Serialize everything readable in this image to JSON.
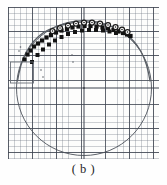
{
  "figure": {
    "caption": "( b )",
    "panel_label": "b",
    "colors": {
      "grid_fine": "#6e7682",
      "grid_major": "#3c424e",
      "circle": "#4a4f58",
      "fit_curve": "#5a5f66",
      "marker_fill": "#111111",
      "marker_open": "#1a1a1a",
      "highlight_box": "#6b7078",
      "caption_text": "#1d1d1d",
      "paper": "#fdfdfc"
    },
    "elements": {
      "circle_label": "reference-circle",
      "box_label": "region-of-interest",
      "center_label": "circle-center",
      "curve_label": "fitted-arc"
    }
  },
  "chart_data": {
    "type": "scatter",
    "title": "",
    "subtitle": "",
    "xlabel": "",
    "ylabel": "",
    "xlim": [
      0,
      151
    ],
    "ylim": [
      0,
      152
    ],
    "grid": true,
    "grid_minor_spacing": 6.05,
    "grid_major_spacing": 24.2,
    "legend": "none",
    "annotations": [
      {
        "name": "reference-circle",
        "type": "circle",
        "cx": 76,
        "cy": 81,
        "r": 67.5,
        "stroke": "#4a4f58",
        "stroke_width": 0.9,
        "fill": "none"
      },
      {
        "name": "circle-center",
        "type": "point",
        "x": 76,
        "y": 81,
        "size": 1.6,
        "color": "#3a3f47"
      },
      {
        "name": "region-of-interest",
        "type": "rect",
        "x": 2.5,
        "y": 55,
        "width": 23,
        "height": 21,
        "stroke": "#6b7078",
        "stroke_width": 0.9,
        "fill": "none"
      },
      {
        "name": "horizontal-axis",
        "type": "line",
        "x1": 0,
        "y1": 81,
        "x2": 151,
        "y2": 81,
        "stroke": "#3c424e",
        "stroke_width": 1.0
      },
      {
        "name": "vertical-axis",
        "type": "line",
        "x1": 76,
        "y1": 0,
        "x2": 76,
        "y2": 152,
        "stroke": "#3c424e",
        "stroke_width": 1.0
      }
    ],
    "series": [
      {
        "name": "fitted-arc",
        "type": "line",
        "stroke": "#5a5f66",
        "stroke_width": 1.3,
        "points": [
          [
            9.5,
            74
          ],
          [
            11,
            66
          ],
          [
            13,
            58
          ],
          [
            15.5,
            51
          ],
          [
            18.5,
            44.5
          ],
          [
            22,
            39
          ],
          [
            26,
            34
          ],
          [
            30.5,
            29.5
          ],
          [
            35.5,
            25.5
          ],
          [
            41,
            22.5
          ],
          [
            47,
            20
          ],
          [
            53,
            18
          ],
          [
            59.5,
            16.5
          ],
          [
            66,
            15.5
          ],
          [
            72.5,
            15
          ],
          [
            79,
            15
          ],
          [
            85.5,
            15.5
          ],
          [
            92,
            16.5
          ],
          [
            98.5,
            18
          ],
          [
            104.5,
            20
          ],
          [
            110.5,
            22.5
          ],
          [
            116,
            25.5
          ],
          [
            121,
            29.5
          ],
          [
            125.5,
            34
          ],
          [
            129.5,
            39
          ],
          [
            133,
            44.5
          ],
          [
            136,
            51
          ],
          [
            138.5,
            58
          ],
          [
            140.5,
            66
          ],
          [
            142,
            74
          ]
        ]
      },
      {
        "name": "filled-square-markers",
        "type": "scatter",
        "marker": "square",
        "color": "#111111",
        "size": 4.2,
        "points": [
          [
            16.5,
            52.5
          ],
          [
            19.5,
            47.5
          ],
          [
            22.5,
            43.5
          ],
          [
            26,
            39.5
          ],
          [
            30,
            36.5
          ],
          [
            34,
            33.5
          ],
          [
            38.5,
            30.5
          ],
          [
            43,
            28
          ],
          [
            48,
            25.5
          ],
          [
            53.5,
            23.5
          ],
          [
            59,
            22
          ],
          [
            64.5,
            20.5
          ],
          [
            70.5,
            19.5
          ],
          [
            76.5,
            19
          ],
          [
            82.5,
            19
          ],
          [
            88.5,
            19.5
          ],
          [
            94.5,
            20.5
          ],
          [
            100,
            21.5
          ],
          [
            105.5,
            23
          ],
          [
            110.5,
            24.5
          ],
          [
            115,
            26
          ],
          [
            119,
            27.5
          ],
          [
            122.5,
            29
          ]
        ]
      },
      {
        "name": "open-circle-markers",
        "type": "scatter",
        "marker": "circle-open",
        "color": "#1a1a1a",
        "size": 5.0,
        "points": [
          [
            44.5,
            24
          ],
          [
            52,
            21
          ],
          [
            60,
            18.5
          ],
          [
            68,
            16.5
          ],
          [
            76,
            15.5
          ],
          [
            84,
            15.5
          ],
          [
            92,
            16.5
          ],
          [
            100,
            18
          ],
          [
            107.5,
            20
          ],
          [
            114,
            22.5
          ],
          [
            119.5,
            25
          ]
        ]
      },
      {
        "name": "offset-square-markers",
        "type": "scatter",
        "marker": "square",
        "color": "#141414",
        "size": 4.0,
        "points": [
          [
            24,
            55
          ],
          [
            29.5,
            48
          ],
          [
            35,
            42.5
          ],
          [
            41,
            37.5
          ],
          [
            47,
            33.5
          ],
          [
            53.5,
            30
          ],
          [
            60,
            27
          ],
          [
            67,
            25
          ],
          [
            74,
            23.5
          ],
          [
            81,
            23
          ],
          [
            88,
            23
          ],
          [
            95,
            23.5
          ],
          [
            101.5,
            24.5
          ],
          [
            108,
            26
          ]
        ]
      },
      {
        "name": "sparse-dot-markers",
        "type": "scatter",
        "marker": "dot",
        "color": "#5c6068",
        "size": 1.6,
        "points": [
          [
            11,
            44
          ],
          [
            12.5,
            40
          ],
          [
            33,
            63
          ],
          [
            35,
            70
          ],
          [
            64,
            48
          ],
          [
            65,
            55
          ]
        ]
      }
    ]
  }
}
